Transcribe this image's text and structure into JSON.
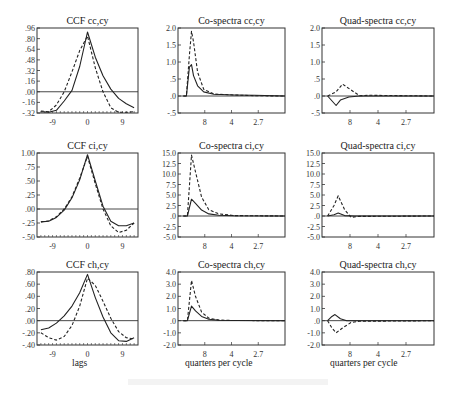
{
  "chart_data": [
    {
      "id": "ccf_cc",
      "type": "line",
      "title": "CCF cc,cy",
      "xlabel": "",
      "ylabel": "",
      "yticks": [
        ".96",
        ".80",
        ".64",
        ".48",
        ".32",
        ".16",
        ".00",
        "-.16",
        "-.32"
      ],
      "ylim": [
        -0.32,
        0.96
      ],
      "xticks": [
        "-9",
        "0",
        "9"
      ],
      "xlim": [
        -13,
        13
      ],
      "series": [
        {
          "name": "solid",
          "style": "solid",
          "x": [
            -12,
            -10,
            -8,
            -6,
            -4,
            -2,
            0,
            2,
            4,
            6,
            8,
            10,
            12
          ],
          "values": [
            -0.3,
            -0.31,
            -0.28,
            -0.14,
            0.02,
            0.38,
            0.9,
            0.52,
            0.24,
            0.04,
            -0.1,
            -0.18,
            -0.24
          ]
        },
        {
          "name": "dashed",
          "style": "dashed",
          "x": [
            -12,
            -10,
            -8,
            -6,
            -4,
            -2,
            0,
            2,
            4,
            6,
            8,
            10,
            12
          ],
          "values": [
            -0.29,
            -0.3,
            -0.2,
            0.0,
            0.3,
            0.62,
            0.84,
            0.36,
            0.0,
            -0.24,
            -0.31,
            -0.31,
            -0.3
          ]
        }
      ]
    },
    {
      "id": "co_cc",
      "type": "line",
      "title": "Co-spectra cc,cy",
      "ylim": [
        -0.5,
        2.0
      ],
      "yticks": [
        "2.0",
        "1.5",
        "1.0",
        ".5",
        ".0",
        "-.5"
      ],
      "xticks": [
        "8",
        "4",
        "2.7"
      ],
      "series": [
        {
          "name": "solid",
          "style": "solid",
          "x": [
            0,
            0.03,
            0.06,
            0.08,
            0.1,
            0.14,
            0.2,
            0.3,
            0.5,
            0.7,
            1.0
          ],
          "values": [
            0,
            0,
            0.85,
            0.92,
            0.6,
            0.3,
            0.12,
            0.05,
            0.03,
            0.02,
            0.0
          ]
        },
        {
          "name": "dashed",
          "style": "dashed",
          "x": [
            0,
            0.03,
            0.06,
            0.08,
            0.1,
            0.14,
            0.2,
            0.3,
            0.5,
            0.7,
            1.0
          ],
          "values": [
            0,
            0,
            1.2,
            1.9,
            1.6,
            0.7,
            0.2,
            0.06,
            0.03,
            0.01,
            0.0
          ]
        }
      ]
    },
    {
      "id": "quad_cc",
      "type": "line",
      "title": "Quad-spectra cc,cy",
      "ylim": [
        -0.5,
        2.0
      ],
      "yticks": [
        "2.0",
        "1.5",
        "1.0",
        ".5",
        ".0",
        "-.5"
      ],
      "xticks": [
        "8",
        "4",
        "2.7"
      ],
      "series": [
        {
          "name": "solid",
          "style": "solid",
          "x": [
            0,
            0.08,
            0.12,
            0.2,
            0.3,
            0.4,
            1.0
          ],
          "values": [
            0,
            -0.28,
            -0.12,
            -0.03,
            0,
            0,
            0
          ]
        },
        {
          "name": "dashed",
          "style": "dashed",
          "x": [
            0,
            0.08,
            0.14,
            0.22,
            0.3,
            0.4,
            1.0
          ],
          "values": [
            0,
            0.12,
            0.35,
            0.18,
            0.01,
            0.02,
            0
          ]
        }
      ]
    },
    {
      "id": "ccf_ci",
      "type": "line",
      "title": "CCF ci,cy",
      "ylim": [
        -0.5,
        1.0
      ],
      "yticks": [
        "1.00",
        ".75",
        ".50",
        ".25",
        ".00",
        "-.25",
        "-.50"
      ],
      "xticks": [
        "-9",
        "0",
        "9"
      ],
      "xlim": [
        -13,
        13
      ],
      "series": [
        {
          "name": "solid",
          "style": "solid",
          "x": [
            -12,
            -10,
            -8,
            -6,
            -4,
            -2,
            0,
            2,
            4,
            6,
            8,
            10,
            12
          ],
          "values": [
            -0.23,
            -0.22,
            -0.15,
            -0.02,
            0.2,
            0.52,
            0.97,
            0.5,
            0.05,
            -0.22,
            -0.3,
            -0.3,
            -0.25
          ]
        },
        {
          "name": "dashed",
          "style": "dashed",
          "x": [
            -12,
            -10,
            -8,
            -6,
            -4,
            -2,
            0,
            2,
            4,
            6,
            8,
            10,
            12
          ],
          "values": [
            -0.23,
            -0.21,
            -0.14,
            0.0,
            0.22,
            0.55,
            0.94,
            0.45,
            0.0,
            -0.3,
            -0.42,
            -0.38,
            -0.25
          ]
        }
      ]
    },
    {
      "id": "co_ci",
      "type": "line",
      "title": "Co-spectra ci,cy",
      "ylim": [
        -5.0,
        15.0
      ],
      "yticks": [
        "15.0",
        "12.5",
        "10.0",
        "7.5",
        "5.0",
        "2.5",
        ".0",
        "-2.5",
        "-5.0"
      ],
      "xticks": [
        "8",
        "4",
        "2.7"
      ],
      "series": [
        {
          "name": "solid",
          "style": "solid",
          "x": [
            0,
            0.04,
            0.08,
            0.12,
            0.18,
            0.25,
            0.35,
            0.5,
            1.0
          ],
          "values": [
            0,
            0,
            4.0,
            3.0,
            1.4,
            0.5,
            0.2,
            0.05,
            0
          ]
        },
        {
          "name": "dashed",
          "style": "dashed",
          "x": [
            0,
            0.04,
            0.08,
            0.12,
            0.18,
            0.25,
            0.35,
            0.5,
            1.0
          ],
          "values": [
            0,
            0,
            14.5,
            10.5,
            4.5,
            1.5,
            0.5,
            0.1,
            0
          ]
        }
      ]
    },
    {
      "id": "quad_ci",
      "type": "line",
      "title": "Quad-spectra ci,cy",
      "ylim": [
        -5.0,
        15.0
      ],
      "yticks": [
        "15.0",
        "12.5",
        "10.0",
        "7.5",
        "5.0",
        "2.5",
        ".0",
        "-2.5",
        "-5.0"
      ],
      "xticks": [
        "8",
        "4",
        "2.7"
      ],
      "series": [
        {
          "name": "solid",
          "style": "solid",
          "x": [
            0,
            0.06,
            0.1,
            0.16,
            0.25,
            1.0
          ],
          "values": [
            0,
            0.3,
            0.7,
            0.1,
            0,
            0
          ]
        },
        {
          "name": "dashed",
          "style": "dashed",
          "x": [
            0,
            0.06,
            0.1,
            0.16,
            0.22,
            0.3,
            1.0
          ],
          "values": [
            0,
            2.5,
            4.8,
            1.5,
            -0.3,
            -0.1,
            0
          ]
        }
      ]
    },
    {
      "id": "ccf_ch",
      "type": "line",
      "title": "CCF ch,cy",
      "xlabel": "lags",
      "ylim": [
        -0.4,
        0.8
      ],
      "yticks": [
        ".80",
        ".60",
        ".40",
        ".20",
        ".00",
        "-.20",
        "-.40"
      ],
      "xticks": [
        "-9",
        "0",
        "9"
      ],
      "xlim": [
        -13,
        13
      ],
      "series": [
        {
          "name": "solid",
          "style": "solid",
          "x": [
            -12,
            -10,
            -8,
            -6,
            -4,
            -2,
            0,
            2,
            4,
            6,
            8,
            10,
            12
          ],
          "values": [
            -0.15,
            -0.12,
            -0.04,
            0.08,
            0.24,
            0.46,
            0.76,
            0.38,
            0.06,
            -0.2,
            -0.33,
            -0.34,
            -0.28
          ]
        },
        {
          "name": "dashed",
          "style": "dashed",
          "x": [
            -12,
            -10,
            -8,
            -6,
            -4,
            -2,
            0,
            2,
            4,
            6,
            8,
            10,
            12
          ],
          "values": [
            -0.2,
            -0.28,
            -0.32,
            -0.26,
            -0.08,
            0.24,
            0.7,
            0.58,
            0.32,
            0.04,
            -0.18,
            -0.28,
            -0.3
          ]
        }
      ]
    },
    {
      "id": "co_ch",
      "type": "line",
      "title": "Co-spectra ch,cy",
      "xlabel": "quarters per cycle",
      "ylim": [
        -2.0,
        4.0
      ],
      "yticks": [
        "4.0",
        "3.0",
        "2.0",
        "1.0",
        ".0",
        "-1.0",
        "-2.0"
      ],
      "xticks": [
        "8",
        "4",
        "2.7"
      ],
      "series": [
        {
          "name": "solid",
          "style": "solid",
          "x": [
            0,
            0.04,
            0.08,
            0.12,
            0.18,
            0.25,
            0.35,
            0.5,
            1.0
          ],
          "values": [
            0,
            0,
            1.2,
            0.8,
            0.35,
            0.12,
            0.04,
            0.01,
            0
          ]
        },
        {
          "name": "dashed",
          "style": "dashed",
          "x": [
            0,
            0.04,
            0.08,
            0.12,
            0.18,
            0.25,
            0.35,
            0.5,
            1.0
          ],
          "values": [
            0,
            0,
            3.3,
            2.0,
            0.7,
            0.2,
            0.05,
            0.01,
            0
          ]
        }
      ]
    },
    {
      "id": "quad_ch",
      "type": "line",
      "title": "Quad-spectra ch,cy",
      "xlabel": "quarters per cycle",
      "ylim": [
        -2.0,
        4.0
      ],
      "yticks": [
        "4.0",
        "3.0",
        "2.0",
        "1.0",
        ".0",
        "-1.0",
        "-2.0"
      ],
      "xticks": [
        "8",
        "4",
        "2.7"
      ],
      "series": [
        {
          "name": "solid",
          "style": "solid",
          "x": [
            0,
            0.04,
            0.07,
            0.12,
            0.18,
            1.0
          ],
          "values": [
            0,
            0.35,
            0.5,
            0.15,
            0,
            0
          ]
        },
        {
          "name": "dashed",
          "style": "dashed",
          "x": [
            0,
            0.04,
            0.08,
            0.14,
            0.22,
            0.3,
            1.0
          ],
          "values": [
            0,
            -0.6,
            -1.0,
            -0.6,
            -0.15,
            -0.05,
            0
          ]
        }
      ]
    }
  ],
  "layout": {
    "cols": [
      {
        "x": 37,
        "w": 101
      },
      {
        "x": 178,
        "w": 107
      },
      {
        "x": 322,
        "w": 112
      }
    ],
    "rows": [
      {
        "y": 28,
        "h": 85
      },
      {
        "y": 153,
        "h": 84
      },
      {
        "y": 272,
        "h": 73
      }
    ]
  },
  "labels": {
    "lags": "lags",
    "qpc_left": "quarters per cycle",
    "qpc_right": "quarters per cycle"
  }
}
